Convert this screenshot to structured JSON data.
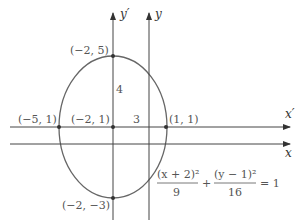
{
  "figure": {
    "axes": {
      "y_prime_label": "y′",
      "y_label": "y",
      "x_prime_label": "x′",
      "x_label": "x"
    },
    "points": [
      {
        "label": "(−2, 5)",
        "x": -2,
        "y": 5
      },
      {
        "label": "(−5, 1)",
        "x": -5,
        "y": 1
      },
      {
        "label": "(−2, 1)",
        "x": -2,
        "y": 1
      },
      {
        "label": "(1, 1)",
        "x": 1,
        "y": 1
      },
      {
        "label": "(−2, −3)",
        "x": -2,
        "y": -3
      }
    ],
    "semi_axis_labels": {
      "vertical": "4",
      "horizontal": "3"
    },
    "equation": {
      "term1_numerator": "(x + 2)²",
      "term1_denominator": "9",
      "plus": "+",
      "term2_numerator": "(y − 1)²",
      "term2_denominator": "16",
      "rhs": "= 1"
    },
    "colors": {
      "curve": "#666666",
      "axis": "#444444",
      "point": "#333333"
    }
  }
}
